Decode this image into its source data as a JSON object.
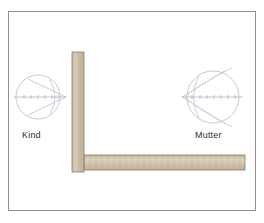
{
  "figure": {
    "title": "",
    "background": "#ffffff",
    "frame": {
      "name": "diagram-frame",
      "stroke": "#9b8c84",
      "x": 8,
      "y": 11,
      "width": 248,
      "height": 200
    }
  },
  "labels": {
    "left": "Kind",
    "right": "Mutter"
  },
  "colors": {
    "eye_stroke": "#b9b3c2",
    "axis_stroke": "#a9a3b4",
    "bar_fill": "#cbbba6",
    "bar_fill_light": "#ddd1be",
    "bar_stroke": "#8a7a62",
    "hatch": "#b8a68e",
    "frame_stroke": "#9b8c84",
    "text": "#2f2f2f"
  },
  "eyes": [
    {
      "name": "eye-kind",
      "label": "Kind",
      "cx": 38,
      "cy": 97,
      "r": 22,
      "cone_direction": "right",
      "cone_apex_x": 66,
      "axis": {
        "x1": 14,
        "x2": 66,
        "y": 97,
        "ticks": 7
      }
    },
    {
      "name": "eye-mutter",
      "label": "Mutter",
      "cx": 213,
      "cy": 97,
      "r": 26,
      "cone_direction": "left",
      "cone_apex_x": 182,
      "axis": {
        "x1": 182,
        "x2": 243,
        "y": 97,
        "ticks": 8
      }
    }
  ],
  "barrier": {
    "name": "t-shaped-barrier",
    "vertical": {
      "x": 72,
      "y": 52,
      "width": 12,
      "height": 120
    },
    "horizontal": {
      "x": 84,
      "y": 155,
      "width": 161,
      "height": 15
    }
  }
}
